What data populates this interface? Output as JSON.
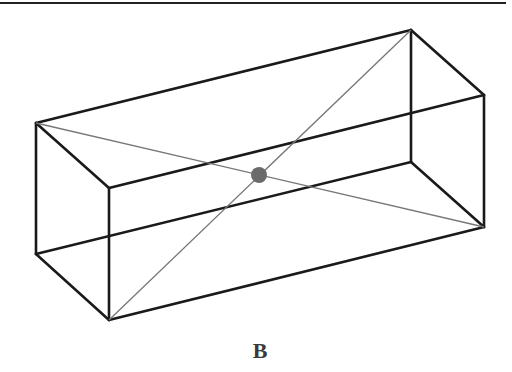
{
  "figure": {
    "caption": "B",
    "colors": {
      "edge": "#1a1a1a",
      "diagonal": "#777777",
      "center_point": "#6b6b6b",
      "rule": "#222222"
    },
    "vertices": {
      "top_front_left": [
        36,
        123
      ],
      "top_back_right": [
        411,
        30
      ],
      "top_back_far": [
        484,
        95
      ],
      "top_front_right": [
        109,
        188
      ],
      "bottom_front_left": [
        36,
        254
      ],
      "bottom_back_right": [
        411,
        162
      ],
      "bottom_back_far": [
        484,
        227
      ],
      "bottom_front_right": [
        109,
        320
      ]
    },
    "center_point": {
      "x": 259,
      "y": 175,
      "r": 8
    },
    "diagonals": [
      {
        "from": "top_front_left",
        "to": "bottom_back_far"
      },
      {
        "from": "top_back_right",
        "to": "bottom_front_right"
      }
    ]
  }
}
